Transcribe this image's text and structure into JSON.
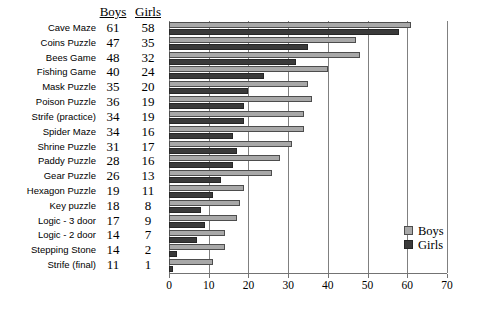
{
  "chart_data": {
    "type": "bar",
    "title": "",
    "subtitle": "",
    "xlabel": "",
    "ylabel": "",
    "orientation": "horizontal",
    "xlim": [
      0,
      70
    ],
    "xticks": [
      0,
      10,
      20,
      30,
      40,
      50,
      60,
      70
    ],
    "grid": "vertical",
    "legend_position": "bottom-right",
    "categories": [
      "Cave Maze",
      "Coins Puzzle",
      "Bees Game",
      "Fishing Game",
      "Mask Puzzle",
      "Poison Puzzle",
      "Strife (practice)",
      "Spider Maze",
      "Shrine Puzzle",
      "Paddy Puzzle",
      "Gear Puzzle",
      "Hexagon Puzzle",
      "Key puzzle",
      "Logic - 3 door",
      "Logic - 2 door",
      "Stepping Stone",
      "Strife (final)"
    ],
    "series": [
      {
        "name": "Boys",
        "color": "#a8a8a8",
        "values": [
          61,
          47,
          48,
          40,
          35,
          36,
          34,
          34,
          31,
          28,
          26,
          19,
          18,
          17,
          14,
          14,
          11
        ]
      },
      {
        "name": "Girls",
        "color": "#3a3a3a",
        "values": [
          58,
          35,
          32,
          24,
          20,
          19,
          19,
          16,
          17,
          16,
          13,
          11,
          8,
          9,
          7,
          2,
          1
        ]
      }
    ]
  },
  "table": {
    "headers": [
      "Boys",
      "Girls"
    ]
  },
  "legend": {
    "items": [
      {
        "label": "Boys"
      },
      {
        "label": "Girls"
      }
    ]
  }
}
